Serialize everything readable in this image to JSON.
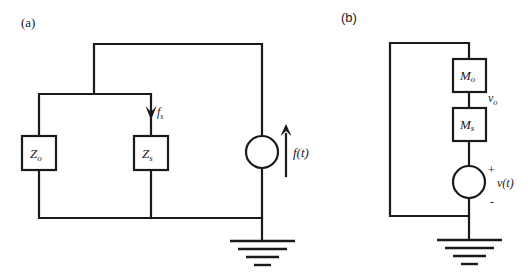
{
  "panel_a": {
    "label": "(a)",
    "impedances": [
      {
        "symbol": "Z",
        "subscript": "o"
      },
      {
        "symbol": "Z",
        "subscript": "s"
      }
    ],
    "branch_flow": {
      "symbol": "f",
      "subscript": "s"
    },
    "source": {
      "label": "f(t)",
      "type": "flow-source"
    },
    "ground": "ground"
  },
  "panel_b": {
    "label": "(b)",
    "masses": [
      {
        "symbol": "M",
        "subscript": "o"
      },
      {
        "symbol": "M",
        "subscript": "s"
      }
    ],
    "node_velocity": {
      "symbol": "v",
      "subscript": "o"
    },
    "source": {
      "label": "v(t)",
      "plus": "+",
      "minus": "-",
      "type": "velocity-source"
    },
    "ground": "ground"
  },
  "colors": {
    "line": "#1a1a1a",
    "background": "#ffffff"
  }
}
